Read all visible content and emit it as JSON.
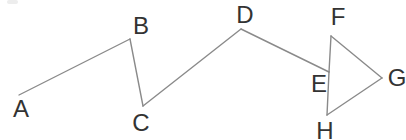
{
  "canvas": {
    "width": 406,
    "height": 140,
    "background": "#ffffff"
  },
  "diagram": {
    "line_color": "#8a8a8a",
    "line_width": 1.4,
    "label_color": "#333333",
    "label_font_size": 24,
    "points": {
      "A": {
        "x": 19,
        "y": 95
      },
      "B": {
        "x": 130,
        "y": 39
      },
      "C": {
        "x": 143,
        "y": 106
      },
      "D": {
        "x": 241,
        "y": 29
      },
      "E": {
        "x": 329,
        "y": 72
      },
      "F": {
        "x": 331,
        "y": 36
      },
      "G": {
        "x": 382,
        "y": 78
      },
      "H": {
        "x": 327,
        "y": 115
      }
    },
    "segments": [
      [
        "A",
        "B"
      ],
      [
        "B",
        "C"
      ],
      [
        "C",
        "D"
      ],
      [
        "D",
        "E"
      ],
      [
        "F",
        "E"
      ],
      [
        "E",
        "H"
      ],
      [
        "F",
        "G"
      ],
      [
        "G",
        "H"
      ]
    ],
    "labels": [
      {
        "text": "A",
        "x": 21,
        "y": 109
      },
      {
        "text": "B",
        "x": 141,
        "y": 26
      },
      {
        "text": "C",
        "x": 141,
        "y": 123
      },
      {
        "text": "D",
        "x": 245,
        "y": 15
      },
      {
        "text": "E",
        "x": 319,
        "y": 84
      },
      {
        "text": "F",
        "x": 338,
        "y": 17
      },
      {
        "text": "G",
        "x": 397,
        "y": 78
      },
      {
        "text": "H",
        "x": 325,
        "y": 131
      }
    ]
  }
}
